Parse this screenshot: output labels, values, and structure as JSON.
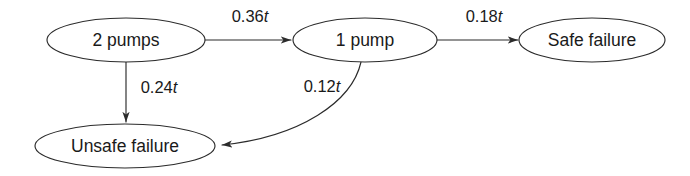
{
  "diagram": {
    "type": "state-transition-diagram",
    "background_color": "#ffffff",
    "stroke_color": "#2b2b2b",
    "text_color": "#1a1a1a",
    "nodes": [
      {
        "id": "two-pumps",
        "label": "2 pumps",
        "cx": 126,
        "cy": 40,
        "rx": 79,
        "ry": 22
      },
      {
        "id": "one-pump",
        "label": "1 pump",
        "cx": 365,
        "cy": 40,
        "rx": 72,
        "ry": 22
      },
      {
        "id": "safe-failure",
        "label": "Safe failure",
        "cx": 592,
        "cy": 40,
        "rx": 73,
        "ry": 22
      },
      {
        "id": "unsafe-failure",
        "label": "Unsafe failure",
        "cx": 125,
        "cy": 146,
        "rx": 90,
        "ry": 22
      }
    ],
    "edges": [
      {
        "id": "two-pumps-to-one-pump",
        "from": "two-pumps",
        "to": "one-pump",
        "rate_value": "0.36",
        "rate_variable": "t",
        "label": "0.36t",
        "label_x": 250,
        "label_y": 18
      },
      {
        "id": "one-pump-to-safe-failure",
        "from": "one-pump",
        "to": "safe-failure",
        "rate_value": "0.18",
        "rate_variable": "t",
        "label": "0.18t",
        "label_x": 484,
        "label_y": 18
      },
      {
        "id": "two-pumps-to-unsafe-failure",
        "from": "two-pumps",
        "to": "unsafe-failure",
        "rate_value": "0.24",
        "rate_variable": "t",
        "label": "0.24t",
        "label_x": 159,
        "label_y": 89
      },
      {
        "id": "one-pump-to-unsafe-failure",
        "from": "one-pump",
        "to": "unsafe-failure",
        "rate_value": "0.12",
        "rate_variable": "t",
        "label": "0.12t",
        "label_x": 322,
        "label_y": 88
      }
    ]
  }
}
